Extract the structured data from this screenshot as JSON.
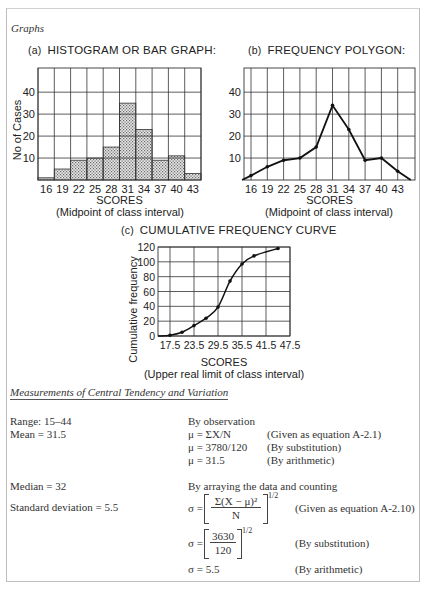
{
  "section_title": "Graphs",
  "chart_data": [
    {
      "type": "bar",
      "label": "(a)",
      "title": "HISTOGRAM OR BAR GRAPH:",
      "categories": [
        "16",
        "19",
        "22",
        "25",
        "28",
        "31",
        "34",
        "37",
        "40",
        "43"
      ],
      "values": [
        1,
        5,
        9,
        10,
        15,
        35,
        23,
        9,
        11,
        3
      ],
      "xlabel": "SCORES",
      "xsublabel": "(Midpoint of class interval)",
      "ylabel": "No of Cases",
      "yticks": [
        10,
        20,
        30,
        40
      ],
      "ylim": [
        0,
        51
      ],
      "grid": true
    },
    {
      "type": "line",
      "label": "(b)",
      "title": "FREQUENCY POLYGON:",
      "categories": [
        "16",
        "19",
        "22",
        "25",
        "28",
        "31",
        "34",
        "37",
        "40",
        "43"
      ],
      "values": [
        2,
        6,
        9,
        10,
        15,
        34,
        23,
        9,
        10,
        4
      ],
      "end_points": [
        0,
        0
      ],
      "xlabel": "SCORES",
      "xsublabel": "(Midpoint of class interval)",
      "ylabel": "",
      "yticks": [
        10,
        20,
        30,
        40
      ],
      "ylim": [
        0,
        51
      ],
      "grid": true
    },
    {
      "type": "line",
      "label": "(c)",
      "title": "CUMULATIVE FREQUENCY CURVE",
      "x": [
        14.5,
        17.5,
        20.5,
        23.5,
        26.5,
        29.5,
        32.5,
        35.5,
        38.5,
        44.5
      ],
      "values": [
        0,
        1,
        5,
        14,
        24,
        39,
        74,
        97,
        108,
        118
      ],
      "xticks": [
        "17.5",
        "23.5",
        "29.5",
        "35.5",
        "41.5",
        "47.5"
      ],
      "yticks": [
        "0",
        "20",
        "40",
        "60",
        "80",
        "100",
        "120"
      ],
      "xlim": [
        14.5,
        47.5
      ],
      "ylim": [
        0,
        120
      ],
      "xlabel": "SCORES",
      "xsublabel": "(Upper real limit of class interval)",
      "ylabel": "Cumulative frequency",
      "grid": true
    }
  ],
  "measurements": {
    "heading": "Measurements of Central Tendency and Variation",
    "range": "Range: 15–44",
    "mean": "Mean = 31.5",
    "median": "Median = 32",
    "sd": "Standard deviation = 5.5",
    "mean_method": "By observation",
    "mean_rows": [
      {
        "eq": "μ = ΣX/N",
        "note": "(Given as equation A-2.1)"
      },
      {
        "eq": "μ = 3780/120",
        "note": "(By substitution)"
      },
      {
        "eq": "μ = 31.5",
        "note": "(By arithmetic)"
      }
    ],
    "median_method": "By arraying the data and counting",
    "sd_rows": [
      {
        "lhs": "σ =",
        "num": "Σ(X − μ)²",
        "den": "N",
        "exp": "1/2",
        "note": "(Given as equation A-2.10)"
      },
      {
        "lhs": "σ =",
        "num": "3630",
        "den": "120",
        "exp": "1/2",
        "note": "(By substitution)"
      },
      {
        "lhs": "σ = 5.5",
        "note": "(By arithmetic)"
      }
    ]
  }
}
